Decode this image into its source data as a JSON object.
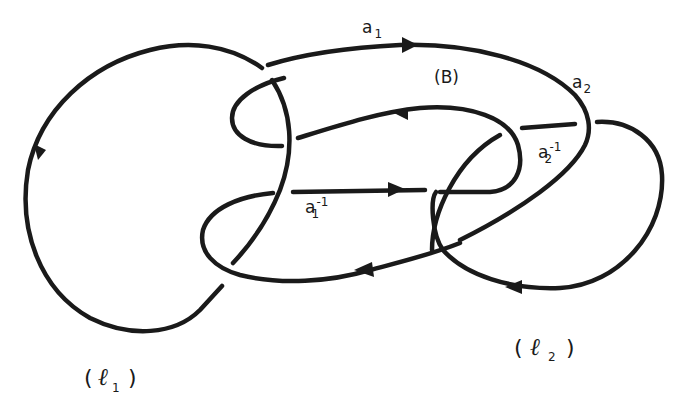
{
  "diagram": {
    "type": "link-diagram",
    "stroke_color": "#1a1a1a",
    "background": "#ffffff",
    "labels": {
      "a1": {
        "base": "a",
        "sub": "1",
        "sup": ""
      },
      "a1_inv": {
        "base": "a",
        "sub": "1",
        "sup": "-1"
      },
      "a2": {
        "base": "a",
        "sub": "2",
        "sup": ""
      },
      "a2_inv": {
        "base": "a",
        "sub": "2",
        "sup": "-1"
      },
      "region_B": "(B)",
      "component_1": {
        "open": "(",
        "letter": "ℓ",
        "sub": "1",
        "close": ")"
      },
      "component_2": {
        "open": "(",
        "letter": "ℓ",
        "sub": "2",
        "close": ")"
      }
    },
    "arrows": [
      {
        "at": "top arc a1",
        "direction": "right"
      },
      {
        "at": "inner upper arc",
        "direction": "left"
      },
      {
        "at": "middle arc a1^-1",
        "direction": "right"
      },
      {
        "at": "lower arc",
        "direction": "left"
      },
      {
        "at": "left loop l1",
        "direction": "down"
      },
      {
        "at": "bottom of l2 loop",
        "direction": "left"
      }
    ]
  }
}
